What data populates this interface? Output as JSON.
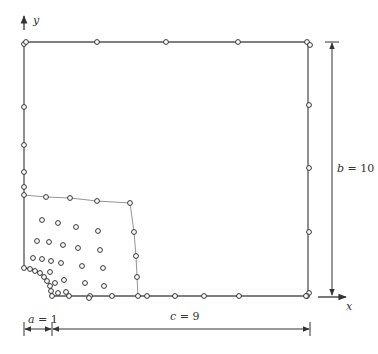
{
  "diagram": {
    "axes": {
      "x_label": "x",
      "y_label": "y"
    },
    "dimensions": {
      "a": {
        "label": "a = 1",
        "var": "a",
        "value": "1"
      },
      "b": {
        "label": "b = 10",
        "var": "b",
        "value": "10"
      },
      "c": {
        "label": "c = 9",
        "var": "c",
        "value": "9"
      }
    },
    "colors": {
      "outline": "#555555",
      "node": "#333333",
      "dimension": "#333333",
      "inner_boundary": "#888888"
    },
    "outline": {
      "left": 24,
      "right": 308,
      "top": 42,
      "bottom": 296,
      "hole_radius_px": 28
    },
    "boundary_nodes": {
      "top": [
        [
          24,
          44
        ],
        [
          26,
          42
        ],
        [
          97,
          42
        ],
        [
          166,
          42
        ],
        [
          238,
          42
        ],
        [
          307,
          42
        ],
        [
          310,
          45
        ]
      ],
      "right": [
        [
          309,
          105
        ],
        [
          309,
          168
        ],
        [
          309,
          232
        ],
        [
          309,
          293
        ],
        [
          307,
          296
        ]
      ],
      "bottom": [
        [
          52,
          296
        ],
        [
          69,
          296
        ],
        [
          90,
          296
        ],
        [
          112,
          296
        ],
        [
          138,
          296
        ],
        [
          147,
          296
        ],
        [
          175,
          296
        ],
        [
          204,
          296
        ],
        [
          239,
          296
        ],
        [
          306,
          296
        ]
      ],
      "left": [
        [
          24,
          44
        ],
        [
          24,
          107
        ],
        [
          24,
          145
        ],
        [
          24,
          172
        ],
        [
          24,
          187
        ],
        [
          24,
          195
        ],
        [
          24,
          268
        ]
      ],
      "hole_arc": [
        [
          24,
          268
        ],
        [
          30,
          269
        ],
        [
          35,
          271
        ],
        [
          40,
          273
        ],
        [
          44,
          277
        ],
        [
          47,
          281
        ],
        [
          50,
          286
        ],
        [
          51,
          291
        ],
        [
          52,
          296
        ]
      ]
    },
    "inner_boundary_nodes": [
      [
        24,
        195
      ],
      [
        46,
        197
      ],
      [
        70,
        198
      ],
      [
        97,
        201
      ],
      [
        130,
        203
      ],
      [
        134,
        232
      ],
      [
        136,
        256
      ],
      [
        137,
        277
      ],
      [
        138,
        296
      ]
    ],
    "interior_nodes": [
      [
        42,
        220
      ],
      [
        58,
        223
      ],
      [
        76,
        227
      ],
      [
        98,
        231
      ],
      [
        37,
        241
      ],
      [
        49,
        242
      ],
      [
        63,
        245
      ],
      [
        78,
        248
      ],
      [
        100,
        250
      ],
      [
        33,
        258
      ],
      [
        42,
        259
      ],
      [
        51,
        261
      ],
      [
        61,
        263
      ],
      [
        82,
        266
      ],
      [
        103,
        268
      ],
      [
        64,
        280
      ],
      [
        85,
        283
      ],
      [
        104,
        286
      ],
      [
        66,
        292
      ],
      [
        89,
        298
      ],
      [
        50,
        272
      ],
      [
        55,
        283
      ],
      [
        58,
        293
      ]
    ]
  }
}
